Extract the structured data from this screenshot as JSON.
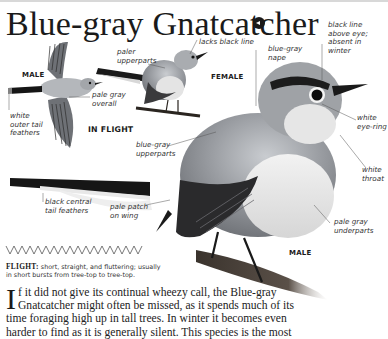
{
  "header": {
    "title": "Blue-gray Gnatcatcher",
    "audio_icon": "speaker-icon"
  },
  "figures": {
    "in_flight": {
      "sex_label": "MALE",
      "pose_label": "IN FLIGHT",
      "annotations": {
        "pale_gray_overall": [
          "pale gray",
          "overall"
        ],
        "white_outer_tail": [
          "white",
          "outer tail",
          "feathers"
        ]
      }
    },
    "female": {
      "label": "FEMALE",
      "annotations": {
        "paler_upperparts": [
          "paler",
          "upperparts"
        ],
        "lacks_black_line": "lacks black line"
      }
    },
    "male_perched": {
      "label": "MALE",
      "annotations": {
        "blue_gray_nape": [
          "blue-gray",
          "nape"
        ],
        "black_line_above_eye": [
          "black line",
          "above eye;",
          "absent in",
          "winter"
        ],
        "white_eye_ring": [
          "white",
          "eye-ring"
        ],
        "white_throat": [
          "white",
          "throat"
        ],
        "blue_gray_upperparts": [
          "blue-gray",
          "upperparts"
        ],
        "black_central_tail": [
          "black central",
          "tail feathers"
        ],
        "pale_patch_on_wing": [
          "pale patch",
          "on wing"
        ],
        "pale_gray_underparts": [
          "pale gray",
          "underparts"
        ]
      }
    }
  },
  "flight_info": {
    "pattern_icon": "zigzag-flight-pattern-icon",
    "heading": "FLIGHT:",
    "text": " short, straight, and fluttering; usually in short bursts from tree-top to tree-top."
  },
  "body_text": {
    "dropcap": "I",
    "lines": [
      "f it did not give its continual wheezy call, the Blue-gray",
      "Gnatcatcher might often be missed, as it spends much of its",
      "time foraging high up in tall trees. In winter it becomes even",
      "harder to find as it is generally silent. This species is the most"
    ]
  },
  "colors": {
    "text": "#231f20",
    "bird_gray": "#8c8f94",
    "bird_dark": "#1c1c1e",
    "branch": "#4a4038"
  }
}
